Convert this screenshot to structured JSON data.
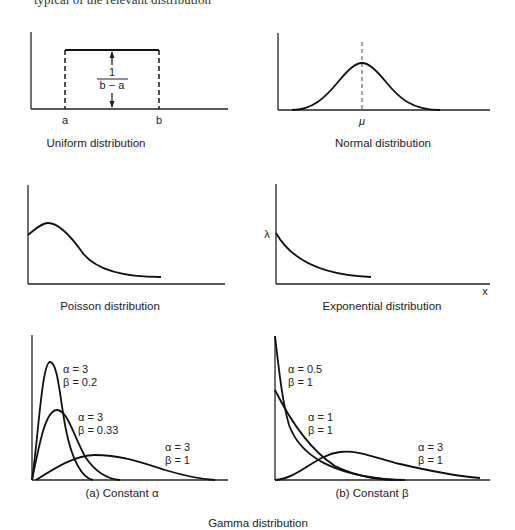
{
  "header_fragment": "typical of the relevant distribution",
  "panels": {
    "uniform": {
      "caption": "Uniform distribution",
      "label_a": "a",
      "label_b": "b",
      "height_numerator": "1",
      "height_denominator": "b − a"
    },
    "normal": {
      "caption": "Normal distribution",
      "label_mu": "μ"
    },
    "poisson": {
      "caption": "Poisson distribution"
    },
    "exponential": {
      "caption": "Exponential distribution",
      "label_lambda": "λ",
      "label_x": "x"
    },
    "gamma_a": {
      "caption": "(a) Constant α",
      "curves": [
        {
          "alpha": "α = 3",
          "beta": "β = 0.2"
        },
        {
          "alpha": "α = 3",
          "beta": "β = 0.33"
        },
        {
          "alpha": "α = 3",
          "beta": "β = 1"
        }
      ]
    },
    "gamma_b": {
      "caption": "(b) Constant β",
      "curves": [
        {
          "alpha": "α = 0.5",
          "beta": "β = 1"
        },
        {
          "alpha": "α = 1",
          "beta": "β = 1"
        },
        {
          "alpha": "α = 3",
          "beta": "β = 1"
        }
      ]
    },
    "gamma_caption": "Gamma distribution"
  }
}
